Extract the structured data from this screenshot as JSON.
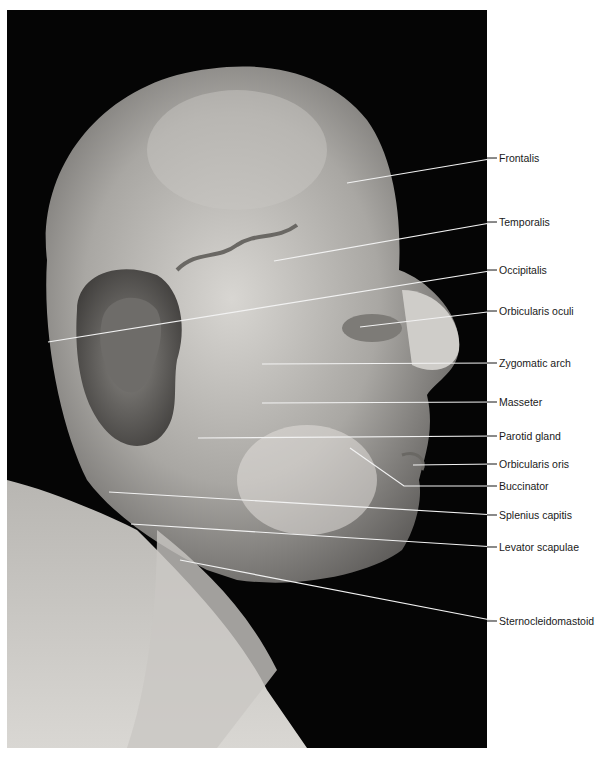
{
  "figure": {
    "background_color": "#050505",
    "label_color": "#1a1a1a"
  },
  "labels": [
    {
      "text": "Frontalis",
      "y": 158,
      "start": [
        347,
        183
      ]
    },
    {
      "text": "Temporalis",
      "y": 222,
      "start": [
        274,
        261
      ]
    },
    {
      "text": "Occipitalis",
      "y": 270,
      "start": [
        48,
        342
      ]
    },
    {
      "text": "Orbicularis oculi",
      "y": 311,
      "start": [
        360,
        327
      ]
    },
    {
      "text": "Zygomatic arch",
      "y": 363,
      "start": [
        262,
        364
      ]
    },
    {
      "text": "Masseter",
      "y": 402,
      "start": [
        262,
        403
      ]
    },
    {
      "text": "Parotid gland",
      "y": 436,
      "start": [
        198,
        438
      ]
    },
    {
      "text": "Orbicularis oris",
      "y": 464,
      "start": [
        413,
        465
      ]
    },
    {
      "text": "Buccinator",
      "y": 486,
      "start": [
        350,
        448
      ],
      "bend": [
        404,
        486
      ]
    },
    {
      "text": "Splenius capitis",
      "y": 515,
      "start": [
        109,
        492
      ]
    },
    {
      "text": "Levator scapulae",
      "y": 547,
      "start": [
        131,
        524
      ]
    },
    {
      "text": "Sternocleidomastoid",
      "y": 621,
      "start": [
        180,
        560
      ]
    }
  ]
}
